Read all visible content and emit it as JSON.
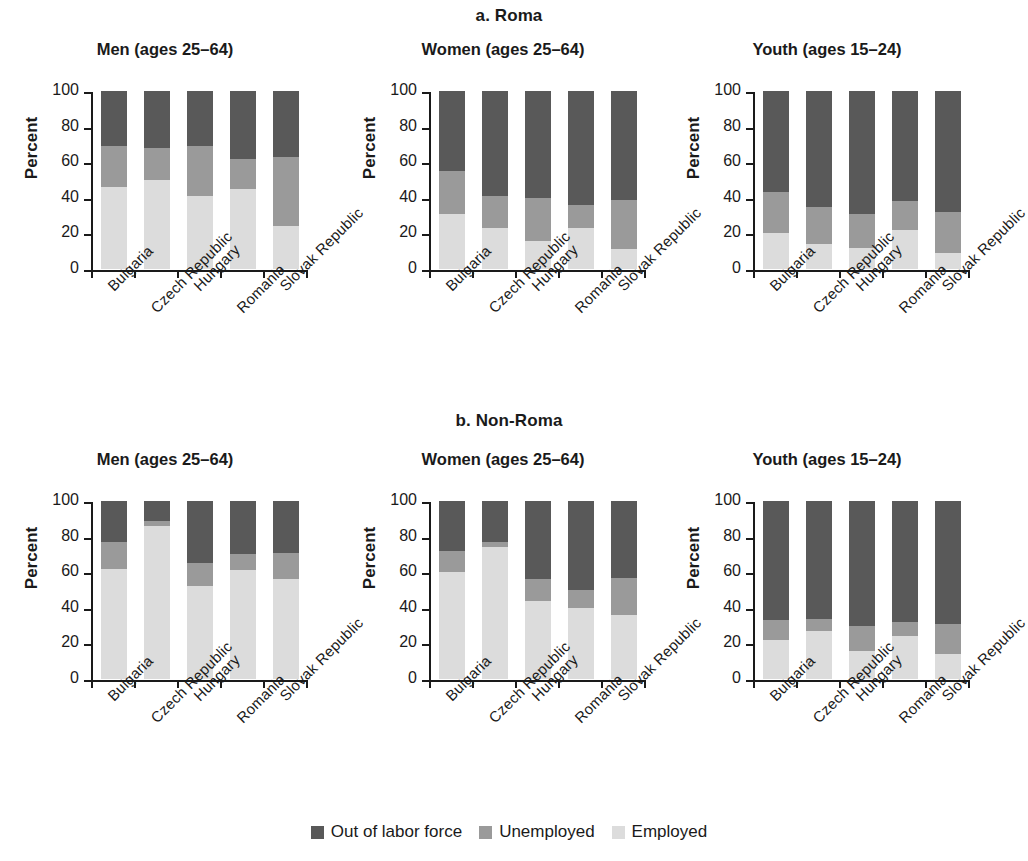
{
  "figure": {
    "panels": [
      {
        "id": "a",
        "title": "a. Roma",
        "charts": [
          {
            "heading": "Men (ages 25–64)",
            "chart_data": {
              "type": "bar",
              "subtype": "stacked-100",
              "title": "Men (ages 25–64)",
              "group_title": "a. Roma",
              "xlabel": "",
              "ylabel": "Percent",
              "ylim": [
                0,
                100
              ],
              "yticks": [
                0,
                20,
                40,
                60,
                80,
                100
              ],
              "grid": false,
              "legend_position": "bottom-figure",
              "categories": [
                "Bulgaria",
                "Czech Republic",
                "Hungary",
                "Romania",
                "Slovak Republic"
              ],
              "series": [
                {
                  "name": "Employed",
                  "color": "#dcdcdc",
                  "values": [
                    46,
                    50,
                    41,
                    45,
                    24
                  ]
                },
                {
                  "name": "Unemployed",
                  "color": "#9a9a9a",
                  "values": [
                    23,
                    18,
                    28,
                    17,
                    39
                  ]
                },
                {
                  "name": "Out of labor force",
                  "color": "#595959",
                  "values": [
                    31,
                    32,
                    31,
                    38,
                    37
                  ]
                }
              ]
            }
          },
          {
            "heading": "Women (ages 25–64)",
            "chart_data": {
              "type": "bar",
              "subtype": "stacked-100",
              "title": "Women (ages 25–64)",
              "group_title": "a. Roma",
              "xlabel": "",
              "ylabel": "Percent",
              "ylim": [
                0,
                100
              ],
              "yticks": [
                0,
                20,
                40,
                60,
                80,
                100
              ],
              "grid": false,
              "legend_position": "bottom-figure",
              "categories": [
                "Bulgaria",
                "Czech Republic",
                "Hungary",
                "Romania",
                "Slovak Republic"
              ],
              "series": [
                {
                  "name": "Employed",
                  "color": "#dcdcdc",
                  "values": [
                    31,
                    23,
                    16,
                    23,
                    11
                  ]
                },
                {
                  "name": "Unemployed",
                  "color": "#9a9a9a",
                  "values": [
                    24,
                    18,
                    24,
                    13,
                    28
                  ]
                },
                {
                  "name": "Out of labor force",
                  "color": "#595959",
                  "values": [
                    45,
                    59,
                    60,
                    64,
                    61
                  ]
                }
              ]
            }
          },
          {
            "heading": "Youth (ages 15–24)",
            "chart_data": {
              "type": "bar",
              "subtype": "stacked-100",
              "title": "Youth (ages 15–24)",
              "group_title": "a. Roma",
              "xlabel": "",
              "ylabel": "Percent",
              "ylim": [
                0,
                100
              ],
              "yticks": [
                0,
                20,
                40,
                60,
                80,
                100
              ],
              "grid": false,
              "legend_position": "bottom-figure",
              "categories": [
                "Bulgaria",
                "Czech Republic",
                "Hungary",
                "Romania",
                "Slovak Republic"
              ],
              "series": [
                {
                  "name": "Employed",
                  "color": "#dcdcdc",
                  "values": [
                    20,
                    14,
                    12,
                    22,
                    9
                  ]
                },
                {
                  "name": "Unemployed",
                  "color": "#9a9a9a",
                  "values": [
                    23,
                    21,
                    19,
                    16,
                    23
                  ]
                },
                {
                  "name": "Out of labor force",
                  "color": "#595959",
                  "values": [
                    57,
                    65,
                    69,
                    62,
                    68
                  ]
                }
              ]
            }
          }
        ]
      },
      {
        "id": "b",
        "title": "b. Non-Roma",
        "charts": [
          {
            "heading": "Men (ages 25–64)",
            "chart_data": {
              "type": "bar",
              "subtype": "stacked-100",
              "title": "Men (ages 25–64)",
              "group_title": "b. Non-Roma",
              "xlabel": "",
              "ylabel": "Percent",
              "ylim": [
                0,
                100
              ],
              "yticks": [
                0,
                20,
                40,
                60,
                80,
                100
              ],
              "grid": false,
              "legend_position": "bottom-figure",
              "categories": [
                "Bulgaria",
                "Czech Republic",
                "Hungary",
                "Romania",
                "Slovak Republic"
              ],
              "series": [
                {
                  "name": "Employed",
                  "color": "#dcdcdc",
                  "values": [
                    62,
                    86,
                    52,
                    61,
                    56
                  ]
                },
                {
                  "name": "Unemployed",
                  "color": "#9a9a9a",
                  "values": [
                    15,
                    3,
                    13,
                    9,
                    15
                  ]
                },
                {
                  "name": "Out of labor force",
                  "color": "#595959",
                  "values": [
                    23,
                    11,
                    35,
                    30,
                    29
                  ]
                }
              ]
            }
          },
          {
            "heading": "Women (ages 25–64)",
            "chart_data": {
              "type": "bar",
              "subtype": "stacked-100",
              "title": "Women (ages 25–64)",
              "group_title": "b. Non-Roma",
              "xlabel": "",
              "ylabel": "Percent",
              "ylim": [
                0,
                100
              ],
              "yticks": [
                0,
                20,
                40,
                60,
                80,
                100
              ],
              "grid": false,
              "legend_position": "bottom-figure",
              "categories": [
                "Bulgaria",
                "Czech Republic",
                "Hungary",
                "Romania",
                "Slovak Republic"
              ],
              "series": [
                {
                  "name": "Employed",
                  "color": "#dcdcdc",
                  "values": [
                    60,
                    74,
                    44,
                    40,
                    36
                  ]
                },
                {
                  "name": "Unemployed",
                  "color": "#9a9a9a",
                  "values": [
                    12,
                    3,
                    12,
                    10,
                    21
                  ]
                },
                {
                  "name": "Out of labor force",
                  "color": "#595959",
                  "values": [
                    28,
                    23,
                    44,
                    50,
                    43
                  ]
                }
              ]
            }
          },
          {
            "heading": "Youth (ages 15–24)",
            "chart_data": {
              "type": "bar",
              "subtype": "stacked-100",
              "title": "Youth (ages 15–24)",
              "group_title": "b. Non-Roma",
              "xlabel": "",
              "ylabel": "Percent",
              "ylim": [
                0,
                100
              ],
              "yticks": [
                0,
                20,
                40,
                60,
                80,
                100
              ],
              "grid": false,
              "legend_position": "bottom-figure",
              "categories": [
                "Bulgaria",
                "Czech Republic",
                "Hungary",
                "Romania",
                "Slovak Republic"
              ],
              "series": [
                {
                  "name": "Employed",
                  "color": "#dcdcdc",
                  "values": [
                    22,
                    27,
                    16,
                    24,
                    14
                  ]
                },
                {
                  "name": "Unemployed",
                  "color": "#9a9a9a",
                  "values": [
                    11,
                    7,
                    14,
                    8,
                    17
                  ]
                },
                {
                  "name": "Out of labor force",
                  "color": "#595959",
                  "values": [
                    67,
                    66,
                    70,
                    68,
                    69
                  ]
                }
              ]
            }
          }
        ]
      }
    ],
    "legend": [
      {
        "label": "Out of labor force",
        "color": "#595959"
      },
      {
        "label": "Unemployed",
        "color": "#9a9a9a"
      },
      {
        "label": "Employed",
        "color": "#dcdcdc"
      }
    ]
  }
}
